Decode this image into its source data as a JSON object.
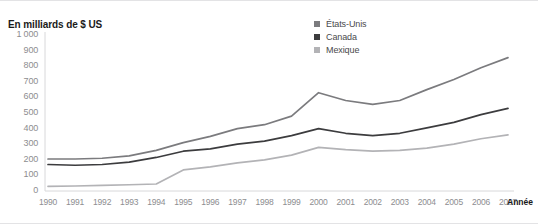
{
  "chart_data": {
    "type": "line",
    "title": "En milliards de $ US",
    "xlabel": "Année",
    "ylabel": "En milliards de $ US",
    "grid": false,
    "legend_position": "top-right",
    "ylim": [
      0,
      1000
    ],
    "yticks": [
      1000,
      900,
      800,
      700,
      600,
      500,
      400,
      300,
      200,
      100,
      0
    ],
    "categories": [
      "1990",
      "1991",
      "1992",
      "1993",
      "1994",
      "1995",
      "1996",
      "1997",
      "1998",
      "1999",
      "2000",
      "2001",
      "2002",
      "2003",
      "2004",
      "2005",
      "2006",
      "2007"
    ],
    "series": [
      {
        "name": "États-Unis",
        "color": "#7b7b7e",
        "values": [
          205,
          205,
          210,
          225,
          260,
          310,
          350,
          400,
          425,
          480,
          630,
          580,
          555,
          580,
          650,
          715,
          790,
          855
        ]
      },
      {
        "name": "Canada",
        "color": "#3c3c3e",
        "values": [
          170,
          165,
          170,
          185,
          215,
          255,
          270,
          300,
          320,
          355,
          400,
          370,
          355,
          370,
          405,
          440,
          490,
          530
        ]
      },
      {
        "name": "Mexique",
        "color": "#b3b3b6",
        "values": [
          30,
          32,
          36,
          40,
          45,
          135,
          155,
          180,
          200,
          230,
          280,
          265,
          255,
          260,
          275,
          300,
          335,
          360
        ]
      }
    ]
  },
  "axes": {
    "y_tick_labels": [
      "1 000",
      "900",
      "800",
      "700",
      "600",
      "500",
      "400",
      "300",
      "200",
      "100",
      "0"
    ],
    "x_tick_labels": [
      "1990",
      "1991",
      "1992",
      "1993",
      "1994",
      "1995",
      "1996",
      "1997",
      "1998",
      "1999",
      "2000",
      "2001",
      "2002",
      "2003",
      "2004",
      "2005",
      "2006",
      "2007"
    ],
    "x_axis_title": "Année"
  },
  "legend": {
    "items": [
      {
        "label": "États-Unis",
        "color": "#7b7b7e"
      },
      {
        "label": "Canada",
        "color": "#3c3c3e"
      },
      {
        "label": "Mexique",
        "color": "#b3b3b6"
      }
    ]
  },
  "colors": {
    "axis_line": "#d8d8da",
    "tick_text": "#8d8d90",
    "title_text": "#1a1a1a",
    "frame_border": "#e3e3e5"
  }
}
